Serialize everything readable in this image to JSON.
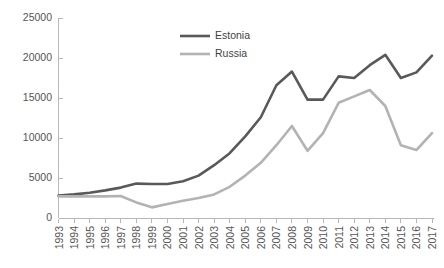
{
  "chart_data": {
    "type": "line",
    "title": "",
    "subtitle": "",
    "xlabel": "",
    "ylabel": "",
    "grid": false,
    "legend_position": "top-center",
    "xlim": [
      1993,
      2017
    ],
    "ylim": [
      0,
      25000
    ],
    "ytick_labels": [
      "0",
      "5000",
      "10000",
      "15000",
      "20000",
      "25000"
    ],
    "ytick_values": [
      0,
      5000,
      10000,
      15000,
      20000,
      25000
    ],
    "categories": [
      "1993",
      "1994",
      "1995",
      "1996",
      "1997",
      "1998",
      "1999",
      "2000",
      "2001",
      "2002",
      "2003",
      "2004",
      "2005",
      "2006",
      "2007",
      "2008",
      "2009",
      "2010",
      "2011",
      "2012",
      "2013",
      "2014",
      "2015",
      "2016",
      "2017"
    ],
    "x": [
      1993,
      1994,
      1995,
      1996,
      1997,
      1998,
      1999,
      2000,
      2001,
      2002,
      2003,
      2004,
      2005,
      2006,
      2007,
      2008,
      2009,
      2010,
      2011,
      2012,
      2013,
      2014,
      2015,
      2016,
      2017
    ],
    "series": [
      {
        "name": "Estonia",
        "color": "#595959",
        "values": [
          2800,
          2950,
          3150,
          3450,
          3800,
          4300,
          4250,
          4250,
          4600,
          5300,
          6600,
          8100,
          10200,
          12600,
          16600,
          18300,
          14800,
          14800,
          17700,
          17500,
          19100,
          20400,
          17500,
          18200,
          20300
        ]
      },
      {
        "name": "Russia",
        "color": "#b3b3b3",
        "values": [
          2700,
          2700,
          2700,
          2700,
          2750,
          1950,
          1330,
          1750,
          2150,
          2500,
          2950,
          3900,
          5300,
          6900,
          9100,
          11500,
          8400,
          10600,
          14400,
          15200,
          16000,
          14000,
          9100,
          8500,
          10600
        ]
      }
    ]
  },
  "legend": {
    "entries": [
      {
        "label": "Estonia",
        "color": "#595959"
      },
      {
        "label": "Russia",
        "color": "#b3b3b3"
      }
    ]
  },
  "axes": {
    "y_axis_name": "value-axis",
    "x_axis_name": "year-axis"
  }
}
